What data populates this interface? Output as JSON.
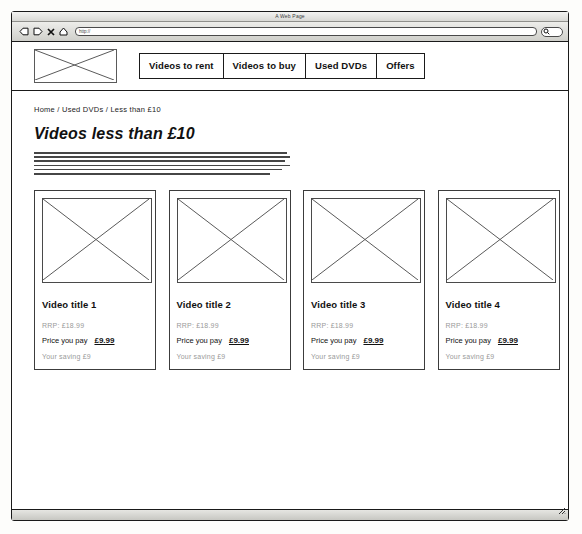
{
  "browser": {
    "window_title": "A Web Page",
    "url_value": "http://",
    "url_placeholder": "http://",
    "search_value": "",
    "icons": {
      "back": "back-arrow-icon",
      "forward": "forward-arrow-icon",
      "stop": "stop-x-icon",
      "home": "home-icon",
      "search": "search-icon",
      "resize": "resize-grip-icon"
    }
  },
  "header": {
    "logo_alt": "image-placeholder",
    "nav": [
      {
        "label": "Videos to rent"
      },
      {
        "label": "Videos to buy"
      },
      {
        "label": "Used DVDs"
      },
      {
        "label": "Offers"
      }
    ]
  },
  "content": {
    "breadcrumb": "Home / Used DVDs / Less than £10",
    "page_title": "Videos less than £10",
    "intro_paragraph": "Lorem ipsum dolor sit amet, consectetur adipiscing elit, sed do eiusmod tempor incididunt ut labore et dolore magna aliqua. Ut enim ad minim veniam, quis nostrud exercitation ullamco laboris nisi ut aliquip ex ea commodo consequat. Duis aute irure dolor in reprehenderit in voluptate velit esse cillum dolore eu fugiat nulla pariatur. Excepteur sint occaecat cupidatat non proident, sunt in culpa qui officia deserunt mollit anim id est laborum. Sed ut perspiciatis unde omnis iste natus error sit voluptatem accusantium doloremque laudantium, totam rem aperiam."
  },
  "labels": {
    "rrp_prefix": "RRP:",
    "price_label": "Price you pay",
    "saving_prefix": "Your saving"
  },
  "products": [
    {
      "title": "Video title 1",
      "rrp": "RRP: £18.99",
      "price_label": "Price you pay",
      "price": "£9.99",
      "saving": "Your saving £9"
    },
    {
      "title": "Video title 2",
      "rrp": "RRP: £18.99",
      "price_label": "Price you pay",
      "price": "£9.99",
      "saving": "Your saving £9"
    },
    {
      "title": "Video title 3",
      "rrp": "RRP: £18.99",
      "price_label": "Price you pay",
      "price": "£9.99",
      "saving": "Your saving £9"
    },
    {
      "title": "Video title 4",
      "rrp": "RRP: £18.99",
      "price_label": "Price you pay",
      "price": "£9.99",
      "saving": "Your saving £9"
    }
  ]
}
